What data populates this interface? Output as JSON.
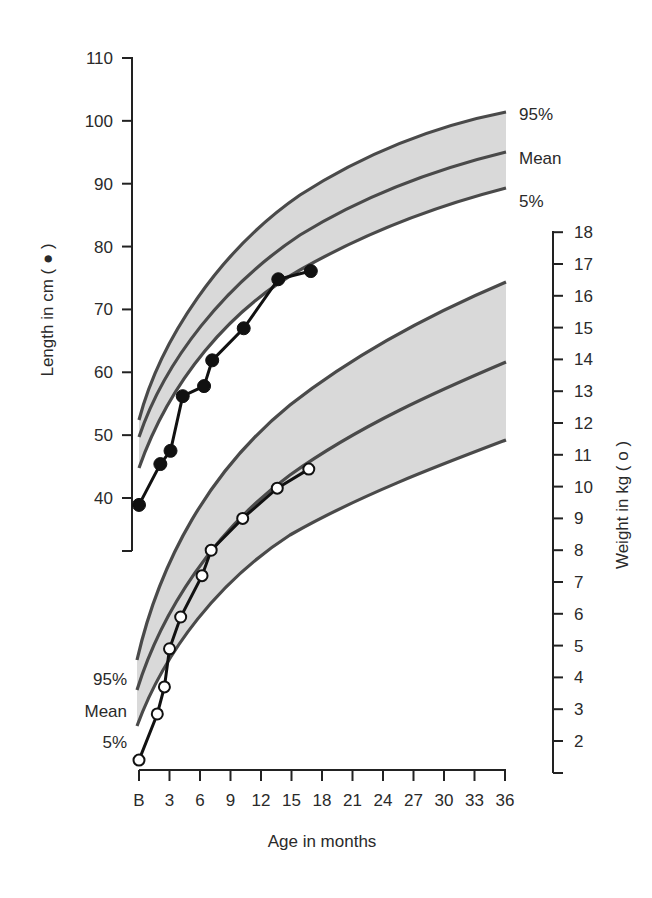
{
  "chart_data": {
    "type": "line",
    "title": "",
    "xlabel": "Age in months",
    "x_ticks": [
      "B",
      "3",
      "6",
      "9",
      "12",
      "15",
      "18",
      "21",
      "24",
      "27",
      "30",
      "33",
      "36"
    ],
    "xlim": [
      0,
      36
    ],
    "left_axis": {
      "label": "Length in cm ( ● )",
      "ticks": [
        "110",
        "100",
        "90",
        "80",
        "70",
        "60",
        "50",
        "40"
      ],
      "ylim": [
        32,
        110
      ]
    },
    "right_axis": {
      "label": "Weight in kg ( o )",
      "ticks": [
        "18",
        "17",
        "16",
        "15",
        "14",
        "13",
        "12",
        "11",
        "10",
        "9",
        "8",
        "7",
        "6",
        "5",
        "4",
        "3",
        "2"
      ],
      "ylim": [
        1,
        18
      ]
    },
    "band_labels": {
      "length": [
        "95%",
        "Mean",
        "5%"
      ],
      "weight": [
        "95%",
        "Mean",
        "5%"
      ]
    },
    "series": [
      {
        "name": "Length (cm)",
        "marker": "filled-circle",
        "axis": "left",
        "x": [
          0,
          2.1,
          3.1,
          4.3,
          6.4,
          7.2,
          10.3,
          13.7,
          16.9
        ],
        "values": [
          38.9,
          45.4,
          47.5,
          56.2,
          57.8,
          61.9,
          67.0,
          74.8,
          76.1
        ]
      },
      {
        "name": "Weight (kg)",
        "marker": "open-circle",
        "axis": "right",
        "x": [
          0,
          1.8,
          2.5,
          3.0,
          4.1,
          6.2,
          7.1,
          10.2,
          13.6,
          16.7
        ],
        "values": [
          1.4,
          2.85,
          3.7,
          4.9,
          5.9,
          7.2,
          8.0,
          9.0,
          9.95,
          10.55
        ]
      }
    ],
    "reference_bands": [
      {
        "name": "Length 95%",
        "x": [
          0,
          6,
          12,
          18,
          24,
          36
        ],
        "values": [
          53.4,
          66,
          74.5,
          81,
          87,
          97.5
        ]
      },
      {
        "name": "Length Mean",
        "x": [
          0,
          6,
          12,
          18,
          24,
          36
        ],
        "values": [
          50.7,
          62,
          70,
          77,
          82.5,
          91.2
        ]
      },
      {
        "name": "Length 5%",
        "x": [
          0,
          6,
          12,
          18,
          24,
          36
        ],
        "values": [
          45.8,
          57.5,
          65.5,
          71.5,
          77,
          85.4
        ]
      },
      {
        "name": "Weight 95%",
        "x": [
          0,
          6,
          12,
          18,
          24,
          36
        ],
        "values": [
          4.5,
          9.0,
          11.7,
          13.5,
          15.0,
          16.4
        ]
      },
      {
        "name": "Weight Mean",
        "x": [
          0,
          6,
          12,
          18,
          24,
          36
        ],
        "values": [
          3.6,
          7.5,
          9.7,
          11.3,
          12.5,
          13.9
        ]
      },
      {
        "name": "Weight 5%",
        "x": [
          0,
          6,
          12,
          18,
          24,
          36
        ],
        "values": [
          2.5,
          6.0,
          8.0,
          9.5,
          10.6,
          11.4
        ]
      }
    ],
    "grid": false
  }
}
